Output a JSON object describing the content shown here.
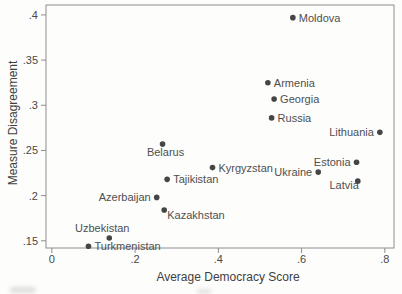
{
  "chart_data": {
    "type": "scatter",
    "title": "",
    "xlabel": "Average Democracy Score",
    "ylabel": "Measure Disagreement",
    "xlim": [
      -0.014,
      0.822
    ],
    "ylim": [
      0.142,
      0.411
    ],
    "grid": false,
    "legend": false,
    "x_ticks": [
      {
        "value": 0.0,
        "label": "0"
      },
      {
        "value": 0.2,
        "label": ".2"
      },
      {
        "value": 0.4,
        "label": ".4"
      },
      {
        "value": 0.6,
        "label": ".6"
      },
      {
        "value": 0.8,
        "label": ".8"
      }
    ],
    "y_ticks": [
      {
        "value": 0.15,
        "label": ".15"
      },
      {
        "value": 0.2,
        "label": ".2"
      },
      {
        "value": 0.25,
        "label": ".25"
      },
      {
        "value": 0.3,
        "label": ".3"
      },
      {
        "value": 0.35,
        "label": ".35"
      },
      {
        "value": 0.4,
        "label": ".4"
      }
    ],
    "points": [
      {
        "label": "Moldova",
        "x": 0.579,
        "y": 0.397,
        "label_pos": "right"
      },
      {
        "label": "Armenia",
        "x": 0.519,
        "y": 0.325,
        "label_pos": "right"
      },
      {
        "label": "Georgia",
        "x": 0.534,
        "y": 0.307,
        "label_pos": "right"
      },
      {
        "label": "Russia",
        "x": 0.528,
        "y": 0.286,
        "label_pos": "right"
      },
      {
        "label": "Lithuania",
        "x": 0.788,
        "y": 0.27,
        "label_pos": "left"
      },
      {
        "label": "Belarus",
        "x": 0.266,
        "y": 0.257,
        "label_pos": "below"
      },
      {
        "label": "Estonia",
        "x": 0.732,
        "y": 0.237,
        "label_pos": "left"
      },
      {
        "label": "Kyrgyzstan",
        "x": 0.386,
        "y": 0.231,
        "label_pos": "right"
      },
      {
        "label": "Ukraine",
        "x": 0.64,
        "y": 0.226,
        "label_pos": "left"
      },
      {
        "label": "Tajikistan",
        "x": 0.277,
        "y": 0.218,
        "label_pos": "right"
      },
      {
        "label": "Latvia",
        "x": 0.735,
        "y": 0.216,
        "label_pos": "below-left"
      },
      {
        "label": "Azerbaijan",
        "x": 0.252,
        "y": 0.198,
        "label_pos": "left"
      },
      {
        "label": "Kazakhstan",
        "x": 0.27,
        "y": 0.184,
        "label_pos": "below-right"
      },
      {
        "label": "Uzbekistan",
        "x": 0.138,
        "y": 0.153,
        "label_pos": "above"
      },
      {
        "label": "Turkmenistan",
        "x": 0.088,
        "y": 0.144,
        "label_pos": "right"
      }
    ],
    "colors": {
      "marker": "#454545",
      "point_label": "#4f4f4f",
      "tick_label": "#4a4a4a",
      "axis_title": "#3f3f3f",
      "frame": "#8e8e8e",
      "background": "#fdfdfc"
    }
  }
}
